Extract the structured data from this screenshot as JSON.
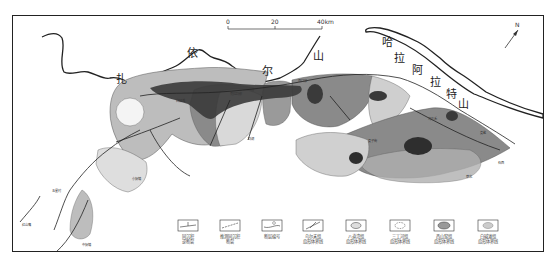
{
  "map": {
    "north_arrow": {
      "label": "N"
    },
    "scale_bar": {
      "ticks": [
        "0",
        "20",
        "40km"
      ]
    },
    "mountain_labels": {
      "yilehuli": [
        "扎",
        "依",
        "尔",
        "山"
      ],
      "halaate": [
        "哈",
        "拉",
        "阿",
        "拉",
        "特",
        "山"
      ]
    },
    "place_labels": [
      {
        "id": "p1",
        "text": "乌兰图",
        "x": 80,
        "y": 193
      },
      {
        "id": "p2",
        "text": "五星村",
        "x": 50,
        "y": 190
      },
      {
        "id": "p3",
        "text": "小拐镇",
        "x": 135,
        "y": 178
      },
      {
        "id": "p4",
        "text": "红山嘴",
        "x": 28,
        "y": 227
      },
      {
        "id": "p5",
        "text": "中拐镇",
        "x": 88,
        "y": 246
      },
      {
        "id": "p6",
        "text": "白碱滩",
        "x": 178,
        "y": 104
      },
      {
        "id": "p7",
        "text": "克拉玛依",
        "x": 235,
        "y": 97
      },
      {
        "id": "p8",
        "text": "夏子街",
        "x": 340,
        "y": 110
      },
      {
        "id": "p9",
        "text": "玛湖",
        "x": 250,
        "y": 145
      },
      {
        "id": "p10",
        "text": "百口泉",
        "x": 300,
        "y": 83
      },
      {
        "id": "p11",
        "text": "乌尔禾",
        "x": 420,
        "y": 123
      },
      {
        "id": "p12",
        "text": "夏盐",
        "x": 485,
        "y": 135
      },
      {
        "id": "p13",
        "text": "石西",
        "x": 497,
        "y": 160
      },
      {
        "id": "p14",
        "text": "莫北",
        "x": 470,
        "y": 175
      }
    ],
    "fault_numbers": [
      "①",
      "②",
      "③",
      "④",
      "⑤",
      "⑥",
      "⑦",
      "⑧",
      "⑨",
      "⑩",
      "⑪",
      "⑫",
      "⑬"
    ]
  },
  "legend": {
    "items": [
      {
        "id": "thrust",
        "label_line1": "同沉积",
        "label_line2": "逆断裂",
        "icon": "thrust-fault-icon"
      },
      {
        "id": "strike_slip",
        "label_line1": "推测同沉积",
        "label_line2": "断裂",
        "icon": "inferred-fault-icon"
      },
      {
        "id": "fault_num",
        "label_line1": "断层编号",
        "label_line2": "",
        "icon": "fault-number-icon"
      },
      {
        "id": "wuerhe",
        "label_line1": "乌尔禾组",
        "label_line2": "扇形体界线",
        "icon": "fan-boundary-arrow-icon"
      },
      {
        "id": "badaowan",
        "label_line1": "八道湾组",
        "label_line2": "扇形体界线",
        "icon": "fan-boundary-solid-icon"
      },
      {
        "id": "sangonghe",
        "label_line1": "三工河组",
        "label_line2": "扇形体界线",
        "icon": "fan-boundary-dashed-icon"
      },
      {
        "id": "xishanyao",
        "label_line1": "西山窑组",
        "label_line2": "扇形体界线",
        "icon": "fan-boundary-shaded-icon"
      },
      {
        "id": "baijiantan",
        "label_line1": "白碱滩组",
        "label_line2": "扇形体界线",
        "icon": "fan-boundary-light-icon"
      }
    ]
  },
  "colors": {
    "frame": "#222222",
    "fan_dark": "#4a4a4a",
    "fan_mid": "#8a8a8a",
    "fan_light": "#bdbdbd",
    "fan_lighter": "#d9d9d9",
    "core": "#2e2e2e"
  }
}
